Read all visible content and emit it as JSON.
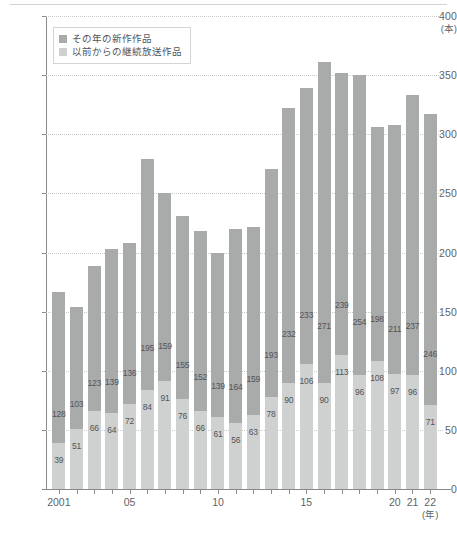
{
  "chart_data": {
    "type": "bar",
    "subtype": "stacked",
    "title": "",
    "xlabel": "(年)",
    "ylabel": "(本)",
    "ylim": [
      0,
      400
    ],
    "ytick_step": 50,
    "yticks": [
      "0",
      "50",
      "100",
      "150",
      "200",
      "250",
      "300",
      "350",
      "400"
    ],
    "grid": true,
    "legend_position": "top-left",
    "categories": [
      "2001",
      "2002",
      "2003",
      "2004",
      "2005",
      "2006",
      "2007",
      "2008",
      "2009",
      "2010",
      "2011",
      "2012",
      "2013",
      "2014",
      "2015",
      "2016",
      "2017",
      "2018",
      "2019",
      "2020",
      "2021",
      "2022"
    ],
    "xtick_labels": [
      {
        "category": "2001",
        "label": "2001"
      },
      {
        "category": "2005",
        "label": "05"
      },
      {
        "category": "2010",
        "label": "10"
      },
      {
        "category": "2015",
        "label": "15"
      },
      {
        "category": "2020",
        "label": "20"
      },
      {
        "category": "2021",
        "label": "21"
      },
      {
        "category": "2022",
        "label": "22"
      }
    ],
    "series": [
      {
        "name": "以前からの継続放送作品",
        "color": "#cfd0d0",
        "stack_position": "bottom",
        "values": [
          39,
          51,
          66,
          64,
          72,
          84,
          91,
          76,
          66,
          61,
          56,
          63,
          78,
          90,
          106,
          90,
          113,
          96,
          108,
          97,
          96,
          71
        ]
      },
      {
        "name": "その年の新作作品",
        "color": "#a9aaaa",
        "stack_position": "top",
        "values": [
          128,
          103,
          123,
          139,
          136,
          195,
          159,
          155,
          152,
          139,
          164,
          159,
          193,
          232,
          233,
          271,
          239,
          254,
          198,
          211,
          237,
          246
        ]
      }
    ],
    "totals": [
      167,
      154,
      189,
      203,
      208,
      279,
      250,
      231,
      218,
      200,
      220,
      222,
      271,
      322,
      339,
      361,
      352,
      350,
      306,
      308,
      333,
      317
    ]
  },
  "legend": {
    "items": [
      {
        "label": "その年の新作作品",
        "color": "#a9aaaa"
      },
      {
        "label": "以前からの継続放送作品",
        "color": "#cfd0d0"
      }
    ]
  },
  "axis": {
    "y_unit": "(本)",
    "x_unit": "(年)"
  }
}
